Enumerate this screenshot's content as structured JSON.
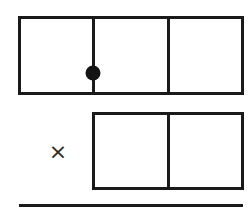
{
  "figure": {
    "background_color": "#ffffff",
    "stroke_color": "#1a1a1a",
    "marker_color": "#141414"
  },
  "bars": [
    {
      "id": "bar-top",
      "name": "top-bar",
      "segments": 3,
      "segment_labels": [
        "",
        "",
        ""
      ],
      "marker": {
        "shape": "filled-circle",
        "at_divider": 1,
        "color": "#141414"
      }
    },
    {
      "id": "bar-bottom",
      "name": "bottom-bar",
      "segments": 2,
      "segment_labels": [
        "",
        ""
      ],
      "marker": null
    }
  ],
  "operator": {
    "symbol": "×",
    "name": "multiplication-sign"
  },
  "rule": {
    "name": "bottom-horizontal-rule",
    "color": "#1a1a1a"
  },
  "chart_data": {
    "type": "bar",
    "xlabel": "",
    "ylabel": "",
    "categories": [
      "top-bar",
      "bottom-bar"
    ],
    "values": [
      3,
      2
    ],
    "series": [
      {
        "name": "segments-per-bar",
        "values": [
          3,
          2
        ]
      }
    ],
    "annotations": [
      {
        "text": "×",
        "role": "operator-between-bars"
      },
      {
        "text": "filled dot at first divider of top bar",
        "role": "marker"
      }
    ],
    "grid": false,
    "legend": "none"
  }
}
